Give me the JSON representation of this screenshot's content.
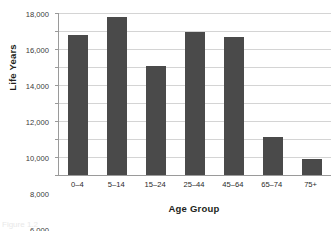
{
  "chart_data": {
    "type": "bar",
    "title": "",
    "xlabel": "Age Group",
    "ylabel": "Life Years",
    "categories": [
      "0–4",
      "5–14",
      "15–24",
      "25–44",
      "45–64",
      "65–74",
      "75+"
    ],
    "values": [
      15600,
      17600,
      12100,
      15900,
      15300,
      4200,
      1750
    ],
    "series": [
      {
        "name": "Life Years",
        "values": [
          15600,
          17600,
          12100,
          15900,
          15300,
          4200,
          1750
        ]
      }
    ],
    "ylim": [
      0,
      18000
    ],
    "ytick_values": [
      0,
      2000,
      4000,
      6000,
      8000,
      10000,
      12000,
      14000,
      16000,
      18000
    ],
    "ytick_labels": [
      "0",
      "2,000",
      "4,000",
      "6,000",
      "8,000",
      "10,000",
      "12,000",
      "14,000",
      "16,000",
      "18,000"
    ],
    "grid": "horizontal",
    "legend": "none",
    "bar_color": "#4a4a4a",
    "gridline_color": "#d4d4d4",
    "axis_color": "#9a9a9a"
  },
  "caption": {
    "text": "Figure 1.2"
  }
}
